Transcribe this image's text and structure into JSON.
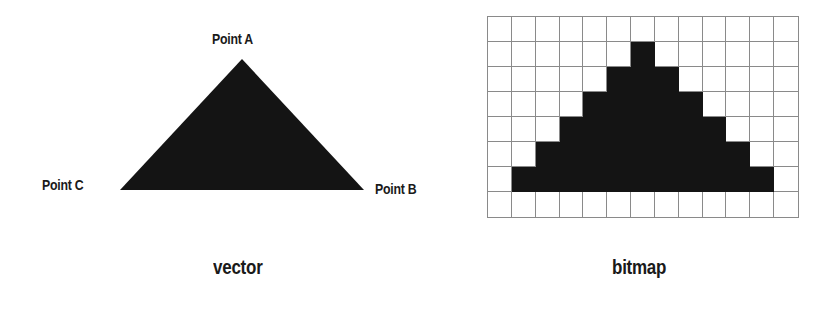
{
  "vector": {
    "caption": "vector",
    "points": {
      "a": {
        "label": "Point A",
        "x": 242,
        "y": 59
      },
      "b": {
        "label": "Point B",
        "x": 364,
        "y": 190
      },
      "c": {
        "label": "Point C",
        "x": 120,
        "y": 190
      }
    },
    "fill_color": "#141414"
  },
  "bitmap": {
    "caption": "bitmap",
    "columns": 13,
    "rows": 8,
    "fill_color": "#141414",
    "grid_color": "#8a8a8a",
    "filled_ranges": [
      null,
      [
        6,
        6
      ],
      [
        5,
        7
      ],
      [
        4,
        8
      ],
      [
        3,
        9
      ],
      [
        2,
        10
      ],
      [
        1,
        11
      ],
      null
    ]
  }
}
